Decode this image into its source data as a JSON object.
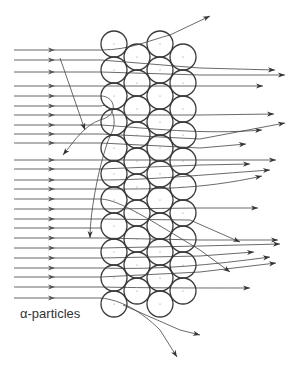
{
  "label": "α-particles",
  "colors": {
    "ink": "#3a3a3a",
    "ray": "#555555",
    "background": "#ffffff"
  },
  "atoms": {
    "radius": 13,
    "columns": [
      {
        "x": 114,
        "ys": [
          44,
          70,
          96,
          122,
          148,
          174,
          200,
          226,
          252,
          278,
          304
        ]
      },
      {
        "x": 137,
        "ys": [
          57,
          83,
          109,
          135,
          161,
          187,
          213,
          239,
          265,
          291
        ]
      },
      {
        "x": 160,
        "ys": [
          44,
          70,
          96,
          122,
          148,
          174,
          200,
          226,
          252,
          278,
          304
        ]
      },
      {
        "x": 183,
        "ys": [
          57,
          83,
          109,
          135,
          161,
          187,
          213,
          239,
          265,
          291
        ]
      }
    ]
  },
  "incoming_rays": {
    "x_start": 14,
    "x_end": 101,
    "arrow_x": 52,
    "ys": [
      50,
      60,
      72,
      86,
      96,
      106,
      115,
      125,
      134,
      143,
      160,
      169,
      180,
      189,
      199,
      209,
      219,
      228,
      238,
      248,
      258,
      268,
      277,
      287,
      298
    ]
  },
  "outgoing_paths": [
    {
      "d": "M101 50 C130 50 150 40 170 35 L210 16",
      "arrow": [
        188,
        26
      ]
    },
    {
      "d": "M101 60 L200 68 L275 70",
      "arrow": [
        258,
        69
      ]
    },
    {
      "d": "M101 72 L200 75 L285 75",
      "arrow": [
        277,
        75
      ]
    },
    {
      "d": "M101 86 L200 86 L263 86",
      "arrow": [
        254,
        86
      ]
    },
    {
      "d": "M101 115 L200 115 L274 114",
      "arrow": [
        258,
        114
      ]
    },
    {
      "d": "M101 125 C150 128 200 135 262 130",
      "arrow": [
        259,
        130
      ]
    },
    {
      "d": "M101 134 L200 139 L285 123",
      "arrow": [
        278,
        124
      ]
    },
    {
      "d": "M101 143 L200 148 L246 144",
      "arrow": [
        240,
        144
      ]
    },
    {
      "d": "M101 160 L200 160 L276 160",
      "arrow": [
        270,
        160
      ]
    },
    {
      "d": "M101 169 L200 165 L250 164",
      "arrow": [
        240,
        164
      ]
    },
    {
      "d": "M101 180 C150 180 200 175 270 170",
      "arrow": [
        261,
        170
      ]
    },
    {
      "d": "M101 189 C150 189 200 190 262 176",
      "arrow": [
        254,
        178
      ]
    },
    {
      "d": "M101 209 L200 208 L258 208",
      "arrow": [
        250,
        208
      ]
    },
    {
      "d": "M101 219 L190 220 L240 242",
      "arrow": [
        230,
        238
      ]
    },
    {
      "d": "M101 238 L200 240 L278 240",
      "arrow": [
        270,
        240
      ]
    },
    {
      "d": "M101 248 L200 246 L280 244",
      "arrow": [
        273,
        244
      ]
    },
    {
      "d": "M101 258 L200 256 L254 252",
      "arrow": [
        248,
        252
      ]
    },
    {
      "d": "M101 268 C160 270 210 265 270 257",
      "arrow": [
        262,
        258
      ]
    },
    {
      "d": "M101 277 L200 272 L276 263",
      "arrow": [
        268,
        264
      ]
    },
    {
      "d": "M101 287 C150 288 190 288 250 288",
      "arrow": [
        244,
        288
      ]
    },
    {
      "d": "M101 96 C115 96 120 115 100 120 C85 125 75 140 63 155",
      "arrow": [
        70,
        146
      ]
    },
    {
      "d": "M101 106 C110 102 120 120 110 136 C100 160 90 210 90 238",
      "arrow": [
        92,
        230
      ]
    },
    {
      "d": "M101 199 C120 200 150 220 200 250 L230 272",
      "arrow": [
        203,
        270
      ]
    },
    {
      "d": "M101 298 C120 300 140 310 160 330 L177 357",
      "arrow": [
        174,
        354
      ]
    },
    {
      "d": "M60 58 L85 130",
      "arrow": [
        58,
        57
      ]
    },
    {
      "d": "M123 305 L180 330 L200 335",
      "arrow": [
        188,
        331
      ]
    }
  ]
}
